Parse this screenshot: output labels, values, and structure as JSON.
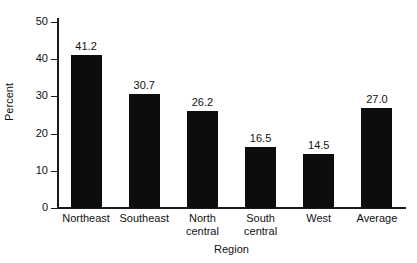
{
  "chart_data": {
    "type": "bar",
    "title": "",
    "subtitle": "",
    "xlabel": "Region",
    "ylabel": "Percent",
    "categories": [
      "Northeast",
      "Southeast",
      "North central",
      "South central",
      "West",
      "Average"
    ],
    "category_lines": [
      [
        "Northeast"
      ],
      [
        "Southeast"
      ],
      [
        "North",
        "central"
      ],
      [
        "South",
        "central"
      ],
      [
        "West"
      ],
      [
        "Average"
      ]
    ],
    "values": [
      41.2,
      30.7,
      26.2,
      16.5,
      14.5,
      27.0
    ],
    "value_labels": [
      "41.2",
      "30.7",
      "26.2",
      "16.5",
      "14.5",
      "27.0"
    ],
    "ylim": [
      0,
      50
    ],
    "yticks": [
      0,
      10,
      20,
      30,
      40,
      50
    ],
    "ytick_labels": [
      "0",
      "10",
      "20",
      "30",
      "40",
      "50"
    ],
    "grid": false,
    "legend": false,
    "bar_color": "#0d0d0d",
    "axis_color": "#1a1a1a",
    "background": "#ffffff"
  }
}
